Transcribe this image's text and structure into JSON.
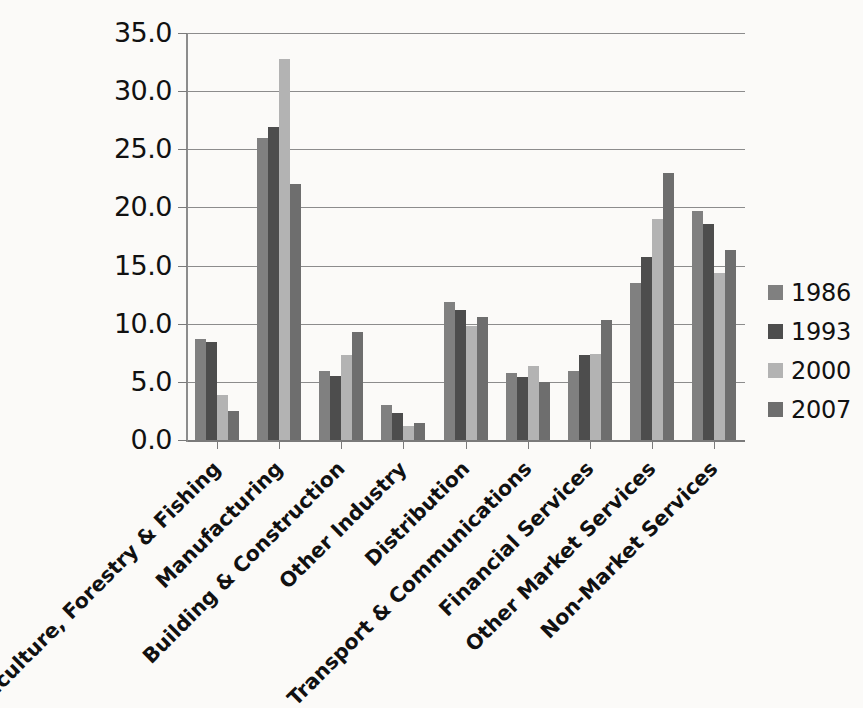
{
  "chart_data": {
    "type": "bar",
    "title": "",
    "xlabel": "",
    "ylabel": "",
    "ylim": [
      0.0,
      35.0
    ],
    "ytick_step": 5.0,
    "ytick_labels": [
      "0.0",
      "5.0",
      "10.0",
      "15.0",
      "20.0",
      "25.0",
      "30.0",
      "35.0"
    ],
    "ytick_values": [
      0.0,
      5.0,
      10.0,
      15.0,
      20.0,
      25.0,
      30.0,
      35.0
    ],
    "grid": "horizontal",
    "legend_position": "right",
    "orientation": "vertical-grouped",
    "categories": [
      "Agriculture, Forestry & Fishing",
      "Manufacturing",
      "Building & Construction",
      "Other Industry",
      "Distribution",
      "Transport & Communications",
      "Financial Services",
      "Other Market Services",
      "Non-Market Services"
    ],
    "series": [
      {
        "name": "1986",
        "color": "#808080",
        "values": [
          8.7,
          26.0,
          5.9,
          3.0,
          11.9,
          5.8,
          5.9,
          13.5,
          19.7
        ]
      },
      {
        "name": "1993",
        "color": "#4d4d4d",
        "values": [
          8.4,
          26.9,
          5.5,
          2.3,
          11.2,
          5.4,
          7.3,
          15.7,
          18.6
        ]
      },
      {
        "name": "2000",
        "color": "#b3b3b3",
        "values": [
          3.9,
          32.8,
          7.3,
          1.2,
          9.8,
          6.4,
          7.4,
          19.0,
          14.4
        ]
      },
      {
        "name": "2007",
        "color": "#6e6e6e",
        "values": [
          2.5,
          22.0,
          9.3,
          1.5,
          10.6,
          5.0,
          10.3,
          23.0,
          16.3
        ]
      }
    ]
  },
  "legend": {
    "entries": [
      {
        "label": "1986",
        "color": "#808080"
      },
      {
        "label": "1993",
        "color": "#4d4d4d"
      },
      {
        "label": "2000",
        "color": "#b3b3b3"
      },
      {
        "label": "2007",
        "color": "#6e6e6e"
      }
    ]
  },
  "caption": {
    "partial_text": ""
  }
}
